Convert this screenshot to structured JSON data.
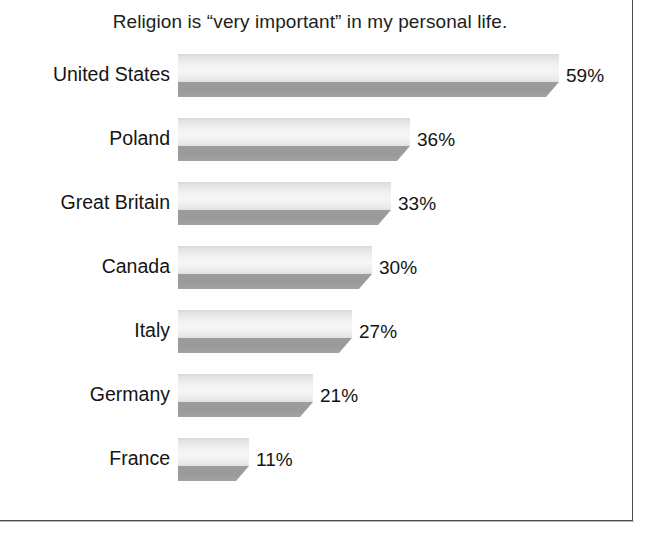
{
  "chart_data": {
    "type": "bar",
    "orientation": "horizontal",
    "title": "Religion is “very important” in my personal life.",
    "xlabel": "",
    "ylabel": "",
    "unit": "%",
    "grid": false,
    "legend": false,
    "xlim": [
      0,
      62
    ],
    "categories": [
      "United States",
      "Poland",
      "Great Britain",
      "Canada",
      "Italy",
      "Germany",
      "France"
    ],
    "values": [
      59,
      36,
      33,
      30,
      27,
      21,
      11
    ],
    "value_labels": [
      "59%",
      "36%",
      "33%",
      "30%",
      "27%",
      "21%",
      "11%"
    ],
    "series": [
      {
        "name": "Religion is “very important” in my personal life.",
        "values": [
          59,
          36,
          33,
          30,
          27,
          21,
          11
        ]
      }
    ]
  },
  "style": {
    "bar_light": "#f2f2f2",
    "bar_dark": "#9c9c9c",
    "text_color": "#141414",
    "frame_color": "#4a4a4a",
    "background": "#ffffff"
  }
}
